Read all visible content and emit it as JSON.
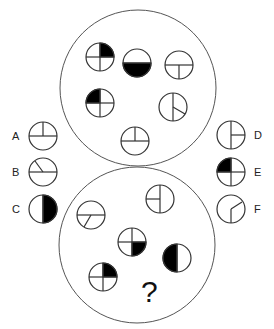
{
  "puzzle": {
    "question_mark": "?",
    "stroke_color": "#333333",
    "fill_color": "#000000",
    "top_group": {
      "figures": [
        {
          "id": "t1",
          "pattern": "quarters-fill-top-right"
        },
        {
          "id": "t2",
          "pattern": "half-fill-bottom"
        },
        {
          "id": "t3",
          "pattern": "horizontal-with-vertical-down"
        },
        {
          "id": "t4",
          "pattern": "quarters-fill-top-left"
        },
        {
          "id": "t5",
          "pattern": "vertical-with-ray-lower-right"
        },
        {
          "id": "t6",
          "pattern": "horizontal-with-vertical-up"
        }
      ]
    },
    "bottom_group": {
      "figures": [
        {
          "id": "b1",
          "pattern": "horizontal-with-ray-lower-left"
        },
        {
          "id": "b2",
          "pattern": "vertical-with-horizontal-left"
        },
        {
          "id": "b3",
          "pattern": "quarters-fill-bottom-right"
        },
        {
          "id": "b4",
          "pattern": "half-fill-left"
        },
        {
          "id": "b5",
          "pattern": "quarters-fill-top-right"
        }
      ]
    },
    "options": [
      {
        "label": "A",
        "pattern": "horizontal-with-vertical-up"
      },
      {
        "label": "B",
        "pattern": "horizontal-with-ray-upper-left"
      },
      {
        "label": "C",
        "pattern": "half-fill-right"
      },
      {
        "label": "D",
        "pattern": "vertical-with-horizontal-right"
      },
      {
        "label": "E",
        "pattern": "quarters-fill-top-left"
      },
      {
        "label": "F",
        "pattern": "vertical-with-ray-upper-right"
      }
    ]
  }
}
